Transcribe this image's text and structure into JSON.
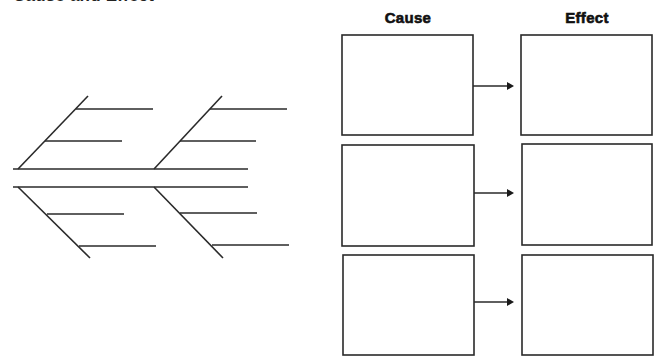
{
  "title": "Cause and Effect",
  "headers": {
    "cause": "Cause",
    "effect": "Effect"
  },
  "fishbone": {
    "spines": 2,
    "bones_per_side": 2,
    "branches_per_bone": 2
  },
  "pairs": [
    {
      "cause": "",
      "effect": ""
    },
    {
      "cause": "",
      "effect": ""
    },
    {
      "cause": "",
      "effect": ""
    }
  ],
  "colors": {
    "stroke": "#2a2a2a",
    "background": "#ffffff",
    "text": "#111111"
  }
}
